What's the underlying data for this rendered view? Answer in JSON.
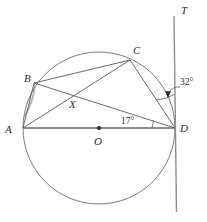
{
  "figure": {
    "kind": "circle-geometry-diagram",
    "width": 207,
    "height": 222,
    "background_color": "#ffffff",
    "stroke_color": "#555555",
    "label_color": "#2b2b2b"
  },
  "circle": {
    "center_label": "O",
    "center": {
      "x": 99,
      "y": 128
    },
    "radius": 76
  },
  "points": [
    {
      "id": "A",
      "label": "A",
      "x": 23,
      "y": 128,
      "on_circle": true
    },
    {
      "id": "B",
      "label": "B",
      "x": 34,
      "y": 83,
      "on_circle": true
    },
    {
      "id": "C",
      "label": "C",
      "x": 130,
      "y": 60,
      "on_circle": true
    },
    {
      "id": "D",
      "label": "D",
      "x": 175,
      "y": 128,
      "on_circle": true
    },
    {
      "id": "O",
      "label": "O",
      "x": 99,
      "y": 128,
      "on_circle": false
    },
    {
      "id": "X",
      "label": "X",
      "x": 74,
      "y": 99,
      "on_circle": false
    }
  ],
  "segments": [
    {
      "id": "AD",
      "from": "A",
      "to": "D",
      "note": "diameter through O"
    },
    {
      "id": "AB",
      "from": "A",
      "to": "B"
    },
    {
      "id": "AC",
      "from": "A",
      "to": "C"
    },
    {
      "id": "BC",
      "from": "B",
      "to": "C"
    },
    {
      "id": "BD",
      "from": "B",
      "to": "D"
    },
    {
      "id": "CD",
      "from": "C",
      "to": "D"
    }
  ],
  "tangent_line": {
    "id": "T",
    "label": "T",
    "top": {
      "x": 174,
      "y": 16
    },
    "bottom": {
      "x": 176,
      "y": 212
    },
    "touches_point": "D"
  },
  "angles": [
    {
      "id": "angle-32",
      "value_text": "32°",
      "at_vertex": "D",
      "between": [
        "DC",
        "DT"
      ],
      "marker": "arc-with-leader"
    },
    {
      "id": "angle-17",
      "value_text": "17°",
      "at_vertex": "D",
      "between": [
        "DA",
        "DB"
      ],
      "marker": "arc"
    }
  ],
  "labels": {
    "A": "A",
    "B": "B",
    "C": "C",
    "D": "D",
    "O": "O",
    "X": "X",
    "T": "T",
    "angle_32": "32°",
    "angle_17": "17°"
  }
}
